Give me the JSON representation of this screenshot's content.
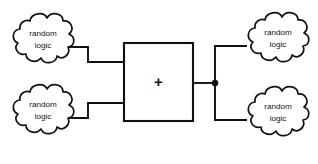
{
  "diagram": {
    "background_color": "#ffffff",
    "line_color": "#111111",
    "nodes": {
      "cloud_top_left": {
        "label_line1": "random",
        "label_line2": "logic",
        "role": "input",
        "position": "top-left"
      },
      "cloud_bottom_left": {
        "label_line1": "random",
        "label_line2": "logic",
        "role": "input",
        "position": "bottom-left"
      },
      "cloud_top_right": {
        "label_line1": "random",
        "label_line2": "logic",
        "role": "output",
        "position": "top-right"
      },
      "cloud_bottom_right": {
        "label_line1": "random",
        "label_line2": "logic",
        "role": "output",
        "position": "bottom-right"
      },
      "adder": {
        "symbol": "+",
        "shape": "rectangle",
        "role": "arithmetic-unit"
      }
    },
    "connections": {
      "input_top_label": "top-left cloud to adder left input",
      "input_bottom_label": "bottom-left cloud to adder left input",
      "output_label": "adder output to fanout junction",
      "fanout_top_label": "junction to top-right cloud",
      "fanout_bottom_label": "junction to bottom-right cloud",
      "junction_label": "fanout junction dot"
    }
  }
}
